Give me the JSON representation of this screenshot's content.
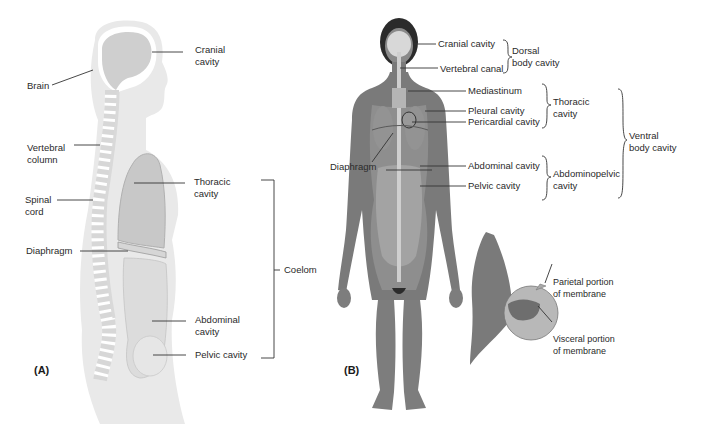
{
  "panel_a": {
    "panel_label": "(A)",
    "labels": {
      "cranial_cavity": [
        "Cranial",
        "cavity"
      ],
      "brain": "Brain",
      "vertebral_column": [
        "Vertebral",
        "column"
      ],
      "spinal_cord": [
        "Spinal",
        "cord"
      ],
      "thoracic_cavity": [
        "Thoracic",
        "cavity"
      ],
      "diaphragm": "Diaphragm",
      "coelom": "Coelom",
      "abdominal_cavity": [
        "Abdominal",
        "cavity"
      ],
      "pelvic_cavity": "Pelvic cavity"
    }
  },
  "panel_b": {
    "panel_label": "(B)",
    "labels": {
      "cranial_cavity": "Cranial cavity",
      "vertebral_canal": "Vertebral canal",
      "dorsal_body_cavity": [
        "Dorsal",
        "body cavity"
      ],
      "mediastinum": "Mediastinum",
      "pleural_cavity": "Pleural cavity",
      "pericardial_cavity": "Pericardial cavity",
      "thoracic_cavity": [
        "Thoracic",
        "cavity"
      ],
      "ventral_body_cavity": [
        "Ventral",
        "body cavity"
      ],
      "diaphragm": "Diaphragm",
      "abdominal_cavity": "Abdominal cavity",
      "pelvic_cavity": "Pelvic cavity",
      "abdominopelvic_cavity": [
        "Abdominopelvic",
        "cavity"
      ],
      "parietal_membrane": [
        "Parietal portion",
        "of membrane"
      ],
      "visceral_membrane": [
        "Visceral portion",
        "of membrane"
      ]
    }
  },
  "colors": {
    "body_light": "#e6e6e6",
    "cavity_gray": "#cfcfcf",
    "body_dark": "#7a7a7a",
    "hair": "#2b2b2b",
    "line": "#333333"
  }
}
